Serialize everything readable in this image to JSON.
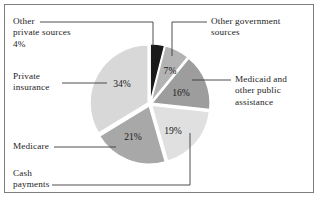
{
  "figure": {
    "frame_color": "#7d7d7d",
    "background": "#ffffff"
  },
  "chart_data": {
    "type": "pie",
    "title": "",
    "xlabel": "",
    "ylabel": "",
    "legend_position": "callout-labels",
    "grid": false,
    "start_angle_deg": 0,
    "direction": "clockwise",
    "categories": [
      "Other private sources",
      "Other government sources",
      "Medicaid and other public assistance",
      "Cash payments",
      "Medicare",
      "Private insurance"
    ],
    "values": [
      4,
      7,
      16,
      19,
      21,
      34
    ],
    "value_labels": [
      "4%",
      "7%",
      "16%",
      "19%",
      "21%",
      "34%"
    ],
    "colors": [
      "#1a1a1a",
      "#b3b3b3",
      "#9d9d9d",
      "#e0e0e0",
      "#a8a8a8",
      "#d8d8d8"
    ],
    "units": "percent"
  },
  "labels": {
    "other_private_sources": {
      "line1": "Other",
      "line2": "private sources",
      "line3": "4%"
    },
    "private_insurance": {
      "line1": "Private",
      "line2": "insurance"
    },
    "medicare": {
      "line1": "Medicare"
    },
    "cash_payments": {
      "line1": "Cash",
      "line2": "payments"
    },
    "other_government_sources": {
      "line1": "Other government",
      "line2": "sources"
    },
    "medicaid": {
      "line1": "Medicaid and",
      "line2": "other public",
      "line3": "assistance"
    }
  },
  "slice_percent_text": {
    "p4": "4%",
    "p7": "7%",
    "p16": "16%",
    "p19": "19%",
    "p21": "21%",
    "p34": "34%"
  }
}
